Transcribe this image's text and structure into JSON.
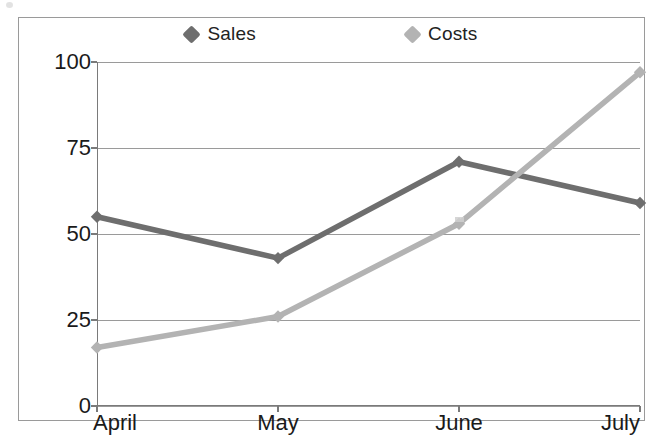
{
  "chart_data": {
    "type": "line",
    "title": "",
    "xlabel": "",
    "ylabel": "",
    "categories": [
      "April",
      "May",
      "June",
      "July"
    ],
    "series": [
      {
        "name": "Sales",
        "values": [
          55,
          43,
          71,
          59
        ],
        "color": "#6e6e6e",
        "marker": "diamond"
      },
      {
        "name": "Costs",
        "values": [
          17,
          26,
          53,
          97
        ],
        "color": "#b3b3b3",
        "marker": "diamond"
      }
    ],
    "ylim": [
      0,
      100
    ],
    "yticks": [
      0,
      25,
      50,
      75,
      100
    ],
    "ytick_labels": [
      "0",
      "25",
      "50",
      "75",
      "100"
    ],
    "grid": true,
    "grid_axis": "y",
    "legend_position": "top",
    "plot_border": true
  },
  "legend": {
    "entries": [
      {
        "label": "Sales",
        "color": "#6e6e6e"
      },
      {
        "label": "Costs",
        "color": "#b3b3b3"
      }
    ]
  },
  "axes": {
    "y_tick_labels": [
      "100",
      "75",
      "50",
      "25",
      "0"
    ],
    "x_tick_labels": [
      "April",
      "May",
      "June",
      "July"
    ]
  },
  "colors": {
    "sales": "#6e6e6e",
    "costs": "#b3b3b3",
    "grid": "#9a9a9a",
    "axis": "#7a7a7a",
    "frame": "#9a9a9a",
    "text": "#1a1a1a",
    "background": "#ffffff"
  }
}
